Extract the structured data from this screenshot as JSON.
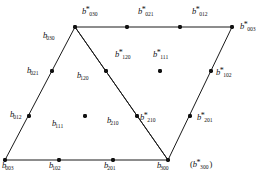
{
  "figure": {
    "type": "control-net-diagram",
    "background_color": "#ffffff",
    "stroke_color": "#1a1a1a",
    "point_color": "#111111",
    "canvas": {
      "width": 271,
      "height": 177
    }
  },
  "polylines": [
    {
      "name": "triangle-left",
      "points": "75,27 5,160 168,160 75,27"
    },
    {
      "name": "triangle-right",
      "points": "75,27 232,27 168,160 75,27"
    }
  ],
  "points": [
    {
      "name": "vertex-b030",
      "x": 75,
      "y": 27
    },
    {
      "name": "edge-top-1",
      "x": 127,
      "y": 27
    },
    {
      "name": "edge-top-2",
      "x": 180,
      "y": 27
    },
    {
      "name": "vertex-b003-star",
      "x": 232,
      "y": 27
    },
    {
      "name": "edge-left-1",
      "x": 52,
      "y": 71
    },
    {
      "name": "edge-left-2",
      "x": 29,
      "y": 116
    },
    {
      "name": "vertex-b003",
      "x": 5,
      "y": 160
    },
    {
      "name": "edge-bottom-1",
      "x": 59,
      "y": 160
    },
    {
      "name": "edge-bottom-2",
      "x": 113,
      "y": 160
    },
    {
      "name": "vertex-b300",
      "x": 168,
      "y": 160
    },
    {
      "name": "edge-right-1",
      "x": 211,
      "y": 71
    },
    {
      "name": "edge-right-2",
      "x": 190,
      "y": 116
    },
    {
      "name": "edge-diag-1",
      "x": 106,
      "y": 71
    },
    {
      "name": "edge-diag-2",
      "x": 137,
      "y": 116
    },
    {
      "name": "interior-b111",
      "x": 85,
      "y": 116
    },
    {
      "name": "interior-b111-star",
      "x": 160,
      "y": 71
    }
  ],
  "labels": [
    {
      "name": "label-b030-star",
      "base": "b",
      "star": true,
      "sub": "030",
      "x": 82,
      "y": 7,
      "paren": false
    },
    {
      "name": "label-b021-star",
      "base": "b",
      "star": true,
      "sub": "021",
      "x": 138,
      "y": 7,
      "paren": false
    },
    {
      "name": "label-b012-star",
      "base": "b",
      "star": true,
      "sub": "012",
      "x": 192,
      "y": 7,
      "paren": false
    },
    {
      "name": "label-b003-star",
      "base": "b",
      "star": true,
      "sub": "003",
      "x": 240,
      "y": 22,
      "paren": false
    },
    {
      "name": "label-b030",
      "base": "b",
      "star": false,
      "sub": "030",
      "x": 43,
      "y": 31,
      "paren": false
    },
    {
      "name": "label-b021",
      "base": "b",
      "star": false,
      "sub": "021",
      "x": 27,
      "y": 66,
      "paren": false
    },
    {
      "name": "label-b012",
      "base": "b",
      "star": false,
      "sub": "012",
      "x": 10,
      "y": 110,
      "paren": false
    },
    {
      "name": "label-b003",
      "base": "b",
      "star": false,
      "sub": "003",
      "x": 2,
      "y": 161,
      "paren": false
    },
    {
      "name": "label-b102",
      "base": "b",
      "star": false,
      "sub": "102",
      "x": 49,
      "y": 161,
      "paren": false
    },
    {
      "name": "label-b201",
      "base": "b",
      "star": false,
      "sub": "201",
      "x": 104,
      "y": 161,
      "paren": false
    },
    {
      "name": "label-b300",
      "base": "b",
      "star": false,
      "sub": "300",
      "x": 157,
      "y": 161,
      "paren": false
    },
    {
      "name": "label-b300-star",
      "base": "b",
      "star": true,
      "sub": "300",
      "x": 190,
      "y": 160,
      "paren": true
    },
    {
      "name": "label-b120-star",
      "base": "b",
      "star": true,
      "sub": "120",
      "x": 115,
      "y": 50,
      "paren": false
    },
    {
      "name": "label-b111-star",
      "base": "b",
      "star": true,
      "sub": "111",
      "x": 153,
      "y": 50,
      "paren": false
    },
    {
      "name": "label-b120",
      "base": "b",
      "star": false,
      "sub": "120",
      "x": 77,
      "y": 71,
      "paren": false
    },
    {
      "name": "label-b111",
      "base": "b",
      "star": false,
      "sub": "111",
      "x": 52,
      "y": 119,
      "paren": false
    },
    {
      "name": "label-b210",
      "base": "b",
      "star": false,
      "sub": "210",
      "x": 107,
      "y": 116,
      "paren": false
    },
    {
      "name": "label-b210-star",
      "base": "b",
      "star": true,
      "sub": "210",
      "x": 140,
      "y": 113,
      "paren": false
    },
    {
      "name": "label-b102-star",
      "base": "b",
      "star": true,
      "sub": "102",
      "x": 216,
      "y": 68,
      "paren": false
    },
    {
      "name": "label-b201-star",
      "base": "b",
      "star": true,
      "sub": "201",
      "x": 197,
      "y": 113,
      "paren": false
    }
  ]
}
